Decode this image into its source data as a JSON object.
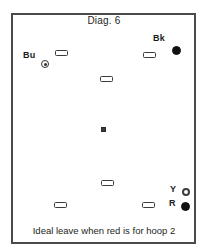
{
  "diagram": {
    "title": "Diag. 6",
    "caption": "Ideal leave when red is for hoop 2",
    "frame_color": "#4a4a4a",
    "background_color": "#ffffff"
  },
  "balls": [
    {
      "id": "blue",
      "label": "Bu",
      "style": "dotted",
      "color": "#2f2f2f",
      "x": 41,
      "y": 60,
      "size": 8,
      "label_x": 23,
      "label_y": 50
    },
    {
      "id": "black",
      "label": "Bk",
      "style": "solid",
      "color": "#111111",
      "x": 172,
      "y": 46,
      "size": 9,
      "label_x": 153,
      "label_y": 33
    },
    {
      "id": "yellow",
      "label": "Y",
      "style": "ring",
      "color": "#3d3d3d",
      "x": 182,
      "y": 188,
      "size": 8,
      "label_x": 170,
      "label_y": 184
    },
    {
      "id": "red",
      "label": "R",
      "style": "solid",
      "color": "#111111",
      "x": 181,
      "y": 202,
      "size": 9,
      "label_x": 169,
      "label_y": 198
    }
  ],
  "hoops": [
    {
      "id": "hoop-upper-left",
      "x": 55,
      "y": 50
    },
    {
      "id": "hoop-upper-right",
      "x": 143,
      "y": 52
    },
    {
      "id": "hoop-middle",
      "x": 100,
      "y": 76
    },
    {
      "id": "hoop-lower-middle",
      "x": 101,
      "y": 180
    },
    {
      "id": "hoop-lower-left",
      "x": 54,
      "y": 202
    },
    {
      "id": "hoop-lower-right",
      "x": 142,
      "y": 202
    }
  ],
  "peg": {
    "id": "center-peg",
    "x": 101,
    "y": 127
  }
}
